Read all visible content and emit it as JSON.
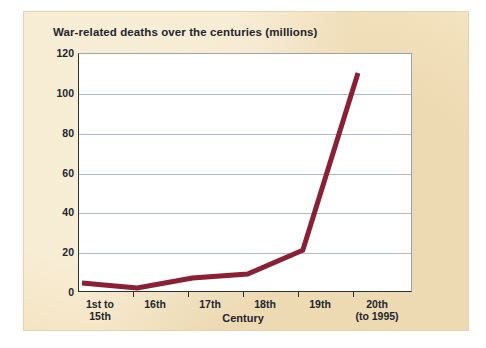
{
  "panel": {
    "background_color": "#f4e3bf"
  },
  "chart_data": {
    "type": "line",
    "title": "War-related deaths over the centuries (millions)",
    "xlabel": "Century",
    "ylabel": "",
    "categories": [
      "1st to\n15th",
      "16th",
      "17th",
      "18th",
      "19th",
      "20th\n(to 1995)"
    ],
    "category_labels": [
      {
        "line1": "1st to",
        "line2": "15th"
      },
      {
        "line1": "16th",
        "line2": ""
      },
      {
        "line1": "17th",
        "line2": ""
      },
      {
        "line1": "18th",
        "line2": ""
      },
      {
        "line1": "19th",
        "line2": ""
      },
      {
        "line1": "20th",
        "line2": "(to 1995)"
      }
    ],
    "values": [
      4.5,
      2,
      7,
      9,
      21,
      110
    ],
    "ylim": [
      0,
      120
    ],
    "yticks": [
      0,
      20,
      40,
      60,
      80,
      100,
      120
    ],
    "ytick_labels": [
      "0",
      "20",
      "40",
      "60",
      "80",
      "100",
      "120"
    ],
    "grid": true,
    "legend": "none",
    "line_color": "#8b1f33",
    "line_width": 5,
    "plot_background": "#ffffff",
    "gridline_color": "#aeb9c6"
  }
}
